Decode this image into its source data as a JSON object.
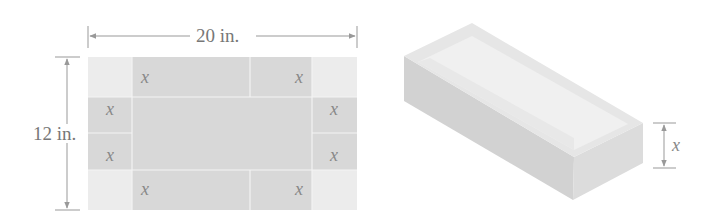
{
  "figure": {
    "flat_sheet": {
      "width_label": "20 in.",
      "height_label": "12 in.",
      "corner_cut_label": "x",
      "corner_labels": [
        "x",
        "x",
        "x",
        "x",
        "x",
        "x",
        "x",
        "x"
      ]
    },
    "box": {
      "height_label": "x"
    },
    "colors": {
      "sheet_center": "#d8d8d8",
      "sheet_corner": "#ececec",
      "fold_line": "#f4f4f4",
      "dimension_line": "#999999",
      "box_top": "#e6e6e6",
      "box_inner_floor": "#f0f0f0",
      "box_front": "#d2d2d2",
      "box_side": "#dcdcdc",
      "text": "#777777"
    }
  }
}
